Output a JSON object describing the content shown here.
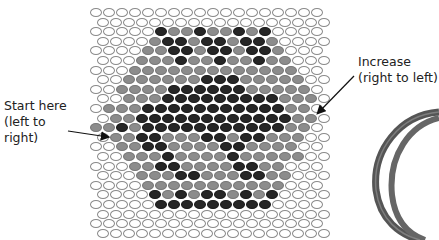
{
  "labels": {
    "start": [
      "Start here",
      "(left to",
      "right)"
    ],
    "increase": [
      "Increase",
      "(right to left)"
    ]
  },
  "colors": {
    "white_bead": "#ffffff",
    "gray_bead": "#8c8c8c",
    "black_bead": "#262626",
    "outline": "#8a8a8a"
  },
  "pattern": {
    "legend": {
      "W": "white",
      "G": "gray",
      "B": "black"
    },
    "beads_per_row": 18,
    "rows": [
      "WWWWWWWWWWWWWWWWWW",
      "WWWWWWWWWWWWWWWWWW",
      "WWWWWBGGBGGBGBWWWW",
      "WWWWGBBGBBGBBGWWWW",
      "WWWWGGBBGBBGBBGWWW",
      "WWWGGGBGGBGGBGGWWW",
      "WWWGGGGGGGGGGGGGWW",
      "WWGGGGGGBBBGGGGGWW",
      "WWGGGGBBBBBBGGGGGW",
      "WWGGGBBBBBBBBBGGGW",
      "WGGGBBBBBBBBBBBGGW",
      "WGGBBBBBBBBBBBBGGW",
      "GGBGBBBBBBBBBBBGGW",
      "WGGBBGGGBBGBBGGGWW",
      "WWGGBBGGGGBBGGGGWW",
      "WWGGGBGGGGBGGGGGWW",
      "WWWGGBBGGGGBBGGWWW",
      "WWWGGGBBGGGBBGGWWW",
      "WWWWGGGGGGGGGGGWWW",
      "WWWWBGBGBBGBGBWWWW",
      "WWWWWBBBBBBBBBWWWW",
      "WWWWWWWWWWWWWWWWWW",
      "WWWWWWWWWWWWWWWWWW",
      "WWWWWWWWWWWWWWWWWW"
    ]
  }
}
